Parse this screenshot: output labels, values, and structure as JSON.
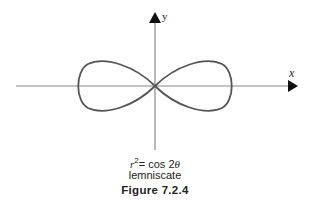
{
  "figure": {
    "x_axis_label": "x",
    "y_axis_label": "y",
    "equation": {
      "var": "r",
      "power": "2",
      "rest": "= cos 2",
      "theta": "θ"
    },
    "curve_name": "lemniscate",
    "caption": "Figure 7.2.4"
  },
  "colors": {
    "curve": "#555555",
    "axis": "#888888",
    "arrow": "#111111"
  }
}
